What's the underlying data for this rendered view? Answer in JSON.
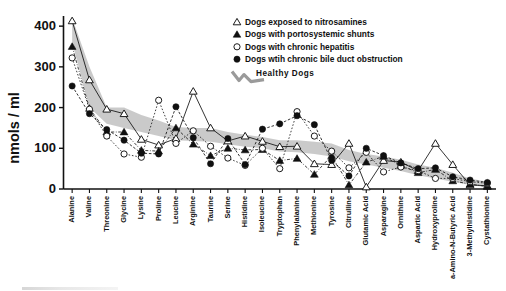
{
  "figure": {
    "ylabel": "nmols / ml",
    "caption": ""
  },
  "legend": {
    "position": "top-right",
    "items": [
      {
        "marker": "open-triangle-icon",
        "label": "Dogs exposed to nitrosamines"
      },
      {
        "marker": "filled-triangle-icon",
        "label": "Dogs with portosystemic shunts"
      },
      {
        "marker": "open-circle-icon",
        "label": "Dogs with chronic hepatitis"
      },
      {
        "marker": "filled-circle-icon",
        "label": "Dogs wtih chronic bile duct obstruction"
      },
      {
        "marker": "squiggle-band-icon",
        "label": "Healthy  Dogs"
      }
    ]
  },
  "chart_data": {
    "type": "line",
    "title": "",
    "xlabel": "",
    "ylabel": "nmols / ml",
    "ylim": [
      0,
      420
    ],
    "yticks": [
      0,
      100,
      200,
      300,
      400
    ],
    "grid": false,
    "legend_position": "top-right",
    "categories": [
      "Alanine",
      "Valine",
      "Threonine",
      "Glycine",
      "Lysine",
      "Proline",
      "Leucine",
      "Arginine",
      "Taurine",
      "Serine",
      "Histidine",
      "Isoleucine",
      "Tryptophan",
      "Phenylalanine",
      "Methionine",
      "Tyrosine",
      "Citrulline",
      "Glutamic Acid",
      "Asparagine",
      "Ornithine",
      "Aspartic Acid",
      "Hydroxyproline",
      "a-Amino-N-Butyric Acid",
      "3-Methylhistidine",
      "Cystathionine"
    ],
    "series": [
      {
        "name": "Dogs exposed to nitrosamines",
        "marker": "open-triangle",
        "line": "solid",
        "values": [
          413,
          268,
          196,
          185,
          122,
          108,
          124,
          240,
          150,
          118,
          130,
          117,
          104,
          105,
          62,
          60,
          112,
          5,
          70,
          66,
          45,
          112,
          60,
          10,
          8
        ]
      },
      {
        "name": "Dogs with portosystemic shunts",
        "marker": "filled-triangle",
        "line": "dash-dot",
        "values": [
          350,
          198,
          140,
          140,
          95,
          93,
          150,
          110,
          82,
          100,
          96,
          97,
          70,
          75,
          36,
          82,
          10,
          66,
          80,
          58,
          40,
          48,
          20,
          12,
          6
        ]
      },
      {
        "name": "Dogs with chronic hepatitis",
        "marker": "open-circle",
        "line": "dotted",
        "values": [
          322,
          196,
          130,
          86,
          78,
          218,
          112,
          143,
          105,
          76,
          58,
          100,
          50,
          190,
          130,
          93,
          52,
          90,
          42,
          54,
          45,
          26,
          26,
          18,
          14
        ]
      },
      {
        "name": "Dogs with chronic bile duct obstruction",
        "marker": "filled-circle",
        "line": "dashed",
        "values": [
          253,
          185,
          146,
          120,
          88,
          86,
          202,
          126,
          62,
          124,
          60,
          147,
          160,
          180,
          158,
          70,
          32,
          100,
          82,
          64,
          50,
          52,
          30,
          22,
          16
        ]
      }
    ],
    "band": {
      "name": "Healthy Dogs",
      "style": "shaded-gray-band",
      "upper": [
        420,
        300,
        200,
        200,
        182,
        168,
        152,
        150,
        150,
        140,
        133,
        128,
        120,
        120,
        116,
        112,
        96,
        86,
        80,
        72,
        60,
        52,
        40,
        26,
        18
      ],
      "lower": [
        360,
        200,
        160,
        150,
        140,
        130,
        120,
        118,
        116,
        110,
        104,
        100,
        92,
        90,
        86,
        80,
        68,
        60,
        52,
        44,
        34,
        26,
        18,
        10,
        4
      ]
    }
  }
}
